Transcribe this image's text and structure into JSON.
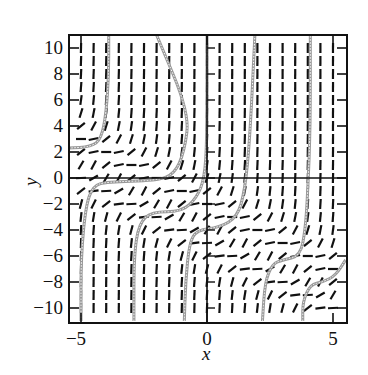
{
  "chart_data": {
    "type": "slope_field",
    "title": "",
    "xlabel": "x",
    "ylabel": "y",
    "xlim": [
      -5.5,
      5.5
    ],
    "ylim": [
      -11,
      11
    ],
    "x_ticks": [
      -5,
      0,
      5
    ],
    "x_tick_labels": [
      "−5",
      "0",
      "5"
    ],
    "y_ticks": [
      10,
      8,
      6,
      4,
      2,
      0,
      -2,
      -4,
      -6,
      -8,
      -10
    ],
    "y_tick_labels": [
      "10",
      "8",
      "6",
      "4",
      "2",
      "0",
      "−2",
      "−4",
      "−6",
      "−8",
      "−10"
    ],
    "grid": false,
    "slope_grid": {
      "x_start": -5,
      "x_end": 5,
      "x_step": 0.5,
      "y_start": -10,
      "y_end": 10,
      "y_step": 1
    },
    "slope_model": "horizontal along bands near y = -x - 2, steep (near vertical) away from them",
    "solution_curves": [
      {
        "name": "curve-1",
        "points": [
          [
            -5.5,
            2.3
          ],
          [
            -4.6,
            2.4
          ],
          [
            -4.2,
            3
          ],
          [
            -4,
            5
          ],
          [
            -3.9,
            8
          ],
          [
            -3.9,
            11
          ]
        ]
      },
      {
        "name": "curve-2",
        "points": [
          [
            -5,
            -11
          ],
          [
            -5,
            -6
          ],
          [
            -4.8,
            -2
          ],
          [
            -4.5,
            -0.6
          ],
          [
            -4,
            -0.3
          ],
          [
            -2,
            -0.2
          ],
          [
            -1.3,
            0.3
          ],
          [
            -0.9,
            2
          ],
          [
            -0.7,
            5
          ],
          [
            -2,
            11
          ]
        ]
      },
      {
        "name": "curve-3",
        "points": [
          [
            -2.9,
            -11
          ],
          [
            -2.9,
            -6
          ],
          [
            -2.7,
            -3.5
          ],
          [
            -2.2,
            -2.6
          ],
          [
            -1,
            -2.6
          ],
          [
            -0.4,
            -1.5
          ],
          [
            -0.1,
            0
          ],
          [
            0,
            3
          ],
          [
            0,
            11
          ]
        ]
      },
      {
        "name": "curve-4",
        "points": [
          [
            -0.9,
            -11
          ],
          [
            -0.85,
            -8
          ],
          [
            -0.7,
            -5
          ],
          [
            -0.4,
            -4
          ],
          [
            0.5,
            -3.8
          ],
          [
            1.2,
            -3
          ],
          [
            1.5,
            -1
          ],
          [
            1.7,
            3
          ],
          [
            1.9,
            11
          ]
        ]
      },
      {
        "name": "curve-5",
        "points": [
          [
            2.2,
            -11
          ],
          [
            2.3,
            -8
          ],
          [
            2.6,
            -6.6
          ],
          [
            3,
            -6.3
          ],
          [
            3.7,
            -6
          ],
          [
            3.9,
            -4
          ],
          [
            4,
            -1
          ],
          [
            4.1,
            4
          ],
          [
            4.1,
            11
          ]
        ]
      },
      {
        "name": "curve-6",
        "points": [
          [
            3.8,
            -11
          ],
          [
            3.8,
            -9.5
          ],
          [
            4.1,
            -8.2
          ],
          [
            4.6,
            -8
          ],
          [
            5.1,
            -7.5
          ],
          [
            5.5,
            -6.3
          ]
        ]
      }
    ]
  }
}
